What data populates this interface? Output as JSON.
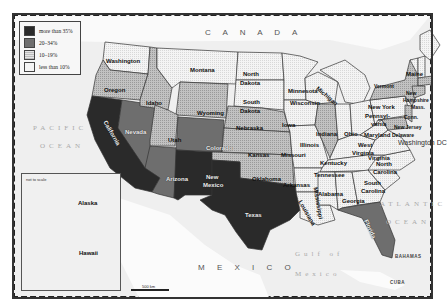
{
  "legend": {
    "items": [
      {
        "label": "more than 35%",
        "color": "#2a2a2a",
        "pattern": "solid"
      },
      {
        "label": "20–34%",
        "color": "#6e6e6e",
        "pattern": "solid"
      },
      {
        "label": "10–19%",
        "color": "#bdbdbd",
        "pattern": "dotted"
      },
      {
        "label": "less than 10%",
        "color": "#f4f4f4",
        "pattern": "dotted"
      }
    ]
  },
  "labels": {
    "countries": {
      "canada": "C A N A D A",
      "mexico": "M E X I C O"
    },
    "oceans": {
      "pacific_1": "PACIFIC",
      "pacific_2": "OCEAN",
      "atlantic_1": "ATLANTIC",
      "atlantic_2": "OCEAN",
      "gulf_1": "Gulf of",
      "gulf_2": "Mexico"
    },
    "other": {
      "bahamas": "BAHAMAS",
      "cuba": "CUBA",
      "dc": "Washington DC"
    },
    "inset_note": "not to scale",
    "scale": "500 km"
  },
  "states": [
    {
      "name": "Washington",
      "category": "less than 10%"
    },
    {
      "name": "Oregon",
      "category": "10–19%"
    },
    {
      "name": "California",
      "category": "more than 35%"
    },
    {
      "name": "Nevada",
      "category": "20–34%"
    },
    {
      "name": "Idaho",
      "category": "10–19%"
    },
    {
      "name": "Montana",
      "category": "less than 10%"
    },
    {
      "name": "Wyoming",
      "category": "10–19%"
    },
    {
      "name": "Utah",
      "category": "10–19%"
    },
    {
      "name": "Arizona",
      "category": "20–34%"
    },
    {
      "name": "Colorado",
      "category": "20–34%"
    },
    {
      "name": "New Mexico",
      "category": "more than 35%"
    },
    {
      "name": "North Dakota",
      "category": "less than 10%"
    },
    {
      "name": "South Dakota",
      "category": "less than 10%"
    },
    {
      "name": "Nebraska",
      "category": "10–19%"
    },
    {
      "name": "Kansas",
      "category": "10–19%"
    },
    {
      "name": "Oklahoma",
      "category": "10–19%"
    },
    {
      "name": "Texas",
      "category": "more than 35%"
    },
    {
      "name": "Minnesota",
      "category": "less than 10%"
    },
    {
      "name": "Iowa",
      "category": "less than 10%"
    },
    {
      "name": "Missouri",
      "category": "less than 10%"
    },
    {
      "name": "Arkansas",
      "category": "less than 10%"
    },
    {
      "name": "Louisiana",
      "category": "less than 10%"
    },
    {
      "name": "Wisconsin",
      "category": "less than 10%"
    },
    {
      "name": "Illinois",
      "category": "10–19%"
    },
    {
      "name": "Michigan",
      "category": "less than 10%"
    },
    {
      "name": "Indiana",
      "category": "less than 10%"
    },
    {
      "name": "Ohio",
      "category": "less than 10%"
    },
    {
      "name": "Kentucky",
      "category": "less than 10%"
    },
    {
      "name": "Tennessee",
      "category": "less than 10%"
    },
    {
      "name": "Mississippi",
      "category": "less than 10%"
    },
    {
      "name": "Alabama",
      "category": "less than 10%"
    },
    {
      "name": "Georgia",
      "category": "less than 10%"
    },
    {
      "name": "Florida",
      "category": "20–34%"
    },
    {
      "name": "South Carolina",
      "category": "less than 10%"
    },
    {
      "name": "North Carolina",
      "category": "less than 10%"
    },
    {
      "name": "Virginia",
      "category": "less than 10%"
    },
    {
      "name": "West Virginia",
      "category": "less than 10%"
    },
    {
      "name": "Maryland",
      "category": "10–19%"
    },
    {
      "name": "Delaware",
      "category": "less than 10%"
    },
    {
      "name": "Pennsylvania",
      "category": "less than 10%"
    },
    {
      "name": "New Jersey",
      "category": "10–19%"
    },
    {
      "name": "New York",
      "category": "10–19%"
    },
    {
      "name": "Vermont",
      "category": "less than 10%"
    },
    {
      "name": "New Hampshire",
      "category": "less than 10%"
    },
    {
      "name": "Maine",
      "category": "less than 10%"
    },
    {
      "name": "Mass.",
      "category": "10–19%"
    },
    {
      "name": "Conn.",
      "category": "10–19%"
    },
    {
      "name": "Alaska",
      "category": "less than 10%"
    },
    {
      "name": "Hawaii",
      "category": "10–19%"
    }
  ],
  "state_labels": {
    "washington": "Washington",
    "oregon": "Oregon",
    "california": "California",
    "nevada": "Nevada",
    "idaho": "Idaho",
    "montana": "Montana",
    "wyoming": "Wyoming",
    "utah": "Utah",
    "arizona": "Arizona",
    "colorado": "Colorado",
    "new_mexico_1": "New",
    "new_mexico_2": "Mexico",
    "north_dakota_1": "North",
    "north_dakota_2": "Dakota",
    "south_dakota_1": "South",
    "south_dakota_2": "Dakota",
    "nebraska": "Nebraska",
    "kansas": "Kansas",
    "oklahoma": "Oklahoma",
    "texas": "Texas",
    "minnesota": "Minnesota",
    "iowa": "Iowa",
    "missouri": "Missouri",
    "arkansas": "Arkansas",
    "louisiana": "Louisiana",
    "wisconsin": "Wisconsin",
    "illinois": "Illinois",
    "michigan": "Michigan",
    "indiana": "Indiana",
    "ohio": "Ohio",
    "kentucky": "Kentucky",
    "tennessee": "Tennessee",
    "mississippi": "Mississippi",
    "alabama": "Alabama",
    "georgia": "Georgia",
    "florida": "Florida",
    "south_carolina_1": "South",
    "south_carolina_2": "Carolina",
    "north_carolina_1": "North",
    "north_carolina_2": "Carolina",
    "virginia": "Virginia",
    "west_virginia_1": "West",
    "west_virginia_2": "Virginia",
    "maryland": "Maryland",
    "delaware": "Delaware",
    "pennsylvania_1": "Pennsyl-",
    "pennsylvania_2": "vania",
    "new_jersey": "New Jersey",
    "new_york": "New York",
    "vermont": "Vermont",
    "new_hampshire_1": "New",
    "new_hampshire_2": "Hampshire",
    "maine": "Maine",
    "mass": "Mass.",
    "conn": "Conn.",
    "alaska": "Alaska",
    "hawaii": "Hawaii"
  }
}
